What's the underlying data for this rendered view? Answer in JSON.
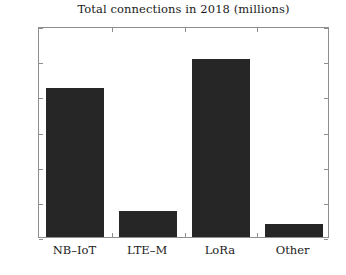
{
  "chart_data": {
    "type": "bar",
    "title": "Total connections in 2018 (millions)",
    "xlabel": "",
    "ylabel": "",
    "categories": [
      "NB–IoT",
      "LTE–M",
      "LoRa",
      "Other"
    ],
    "values": [
      42.3,
      7.4,
      50.6,
      3.7
    ],
    "ylim": [
      0,
      60
    ],
    "yticks": [
      0,
      10,
      20,
      30,
      40,
      50,
      60
    ],
    "ytick_labels": [
      "0",
      "10",
      "20",
      "30",
      "40",
      "50",
      "60"
    ],
    "grid": false,
    "legend": null,
    "bar_color": "#262626",
    "axis_color": "#8e8e8e",
    "background_color": "#ffffff"
  }
}
